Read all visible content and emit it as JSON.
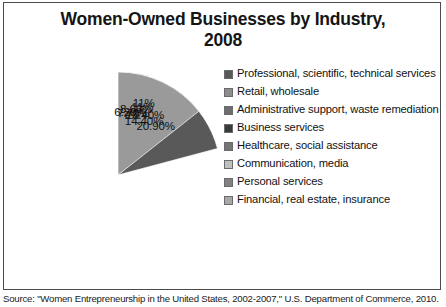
{
  "chart": {
    "title": "Women-Owned Businesses by Industry, 2008",
    "title_line1": "Women-Owned Businesses by Industry,",
    "title_line2": "2008"
  },
  "caption": {
    "text": "Source: \"Women Entrepreneurship in the United States, 2002-2007,\" U.S. Department of Commerce, 2010."
  },
  "legend": {
    "items": [
      {
        "label": "Professional, scientific, technical services",
        "color": "#595959"
      },
      {
        "label": "Retail, wholesale",
        "color": "#8c8c8c"
      },
      {
        "label": "Administrative support, waste remediation",
        "color": "#6e6e6e"
      },
      {
        "label": "Business services",
        "color": "#3a3a3a"
      },
      {
        "label": "Healthcare, social assistance",
        "color": "#767676"
      },
      {
        "label": "Communication, media",
        "color": "#bfbfbf"
      },
      {
        "label": "Personal services",
        "color": "#828282"
      },
      {
        "label": "Financial, real estate, insurance",
        "color": "#a8a8a8"
      }
    ]
  },
  "chart_data": {
    "type": "pie",
    "title": "Women-Owned Businesses by Industry, 2008",
    "xlabel": "",
    "ylabel": "",
    "legend_position": "right",
    "grid": false,
    "start_angle_deg": 0,
    "direction": "clockwise",
    "categories": [
      "Professional, scientific, technical services",
      "Retail, wholesale",
      "Administrative support, waste remediation",
      "Business services",
      "Healthcare, social assistance",
      "Communication, media",
      "Personal services",
      "Financial, real estate, insurance",
      "Other"
    ],
    "values": [
      20.9,
      13.4,
      11.0,
      11.0,
      8.6,
      7.7,
      7.0,
      6.2,
      14.4
    ],
    "labels": [
      "20.90%",
      "13.40%",
      "11%",
      "11%",
      "8.60%",
      "7.70%",
      "7%",
      "6.20%",
      "14.40%"
    ],
    "colors": [
      "#595959",
      "#8c8c8c",
      "#6e6e6e",
      "#3a3a3a",
      "#767676",
      "#bfbfbf",
      "#828282",
      "#a8a8a8",
      "#9a9a9a"
    ],
    "units": "percent"
  },
  "slice_labels": {
    "s0": "20.90%",
    "s1": "13.40%",
    "s2": "11%",
    "s3": "11%",
    "s4": "8.60%",
    "s5": "7.70%",
    "s6": "7%",
    "s7": "6.20%",
    "s8": "14.40%"
  }
}
